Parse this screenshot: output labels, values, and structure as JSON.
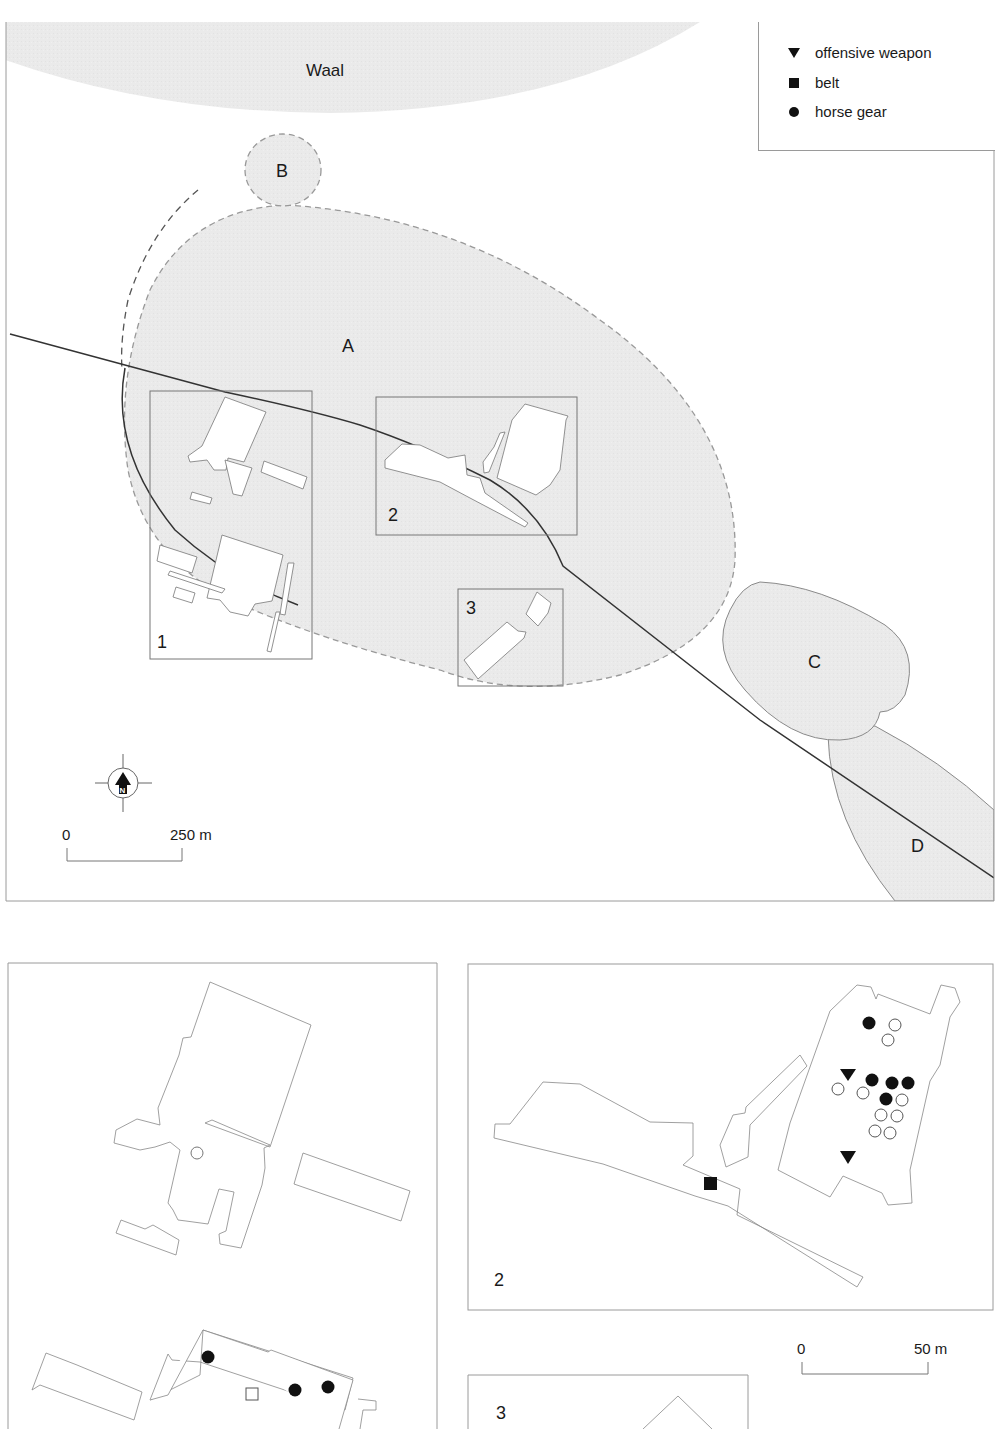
{
  "overview_map": {
    "river_label": "Waal",
    "zones": [
      {
        "id": "A",
        "label": "A"
      },
      {
        "id": "B",
        "label": "B"
      },
      {
        "id": "C",
        "label": "C"
      },
      {
        "id": "D",
        "label": "D"
      }
    ],
    "inset_boxes": [
      {
        "id": "1",
        "label": "1"
      },
      {
        "id": "2",
        "label": "2"
      },
      {
        "id": "3",
        "label": "3"
      }
    ],
    "north_arrow": {
      "label": "N"
    },
    "scale_bar": {
      "start": "0",
      "end": "250 m"
    }
  },
  "legend": {
    "items": [
      {
        "symbol": "triangle-down-filled",
        "label": "offensive weapon"
      },
      {
        "symbol": "square-filled",
        "label": "belt"
      },
      {
        "symbol": "circle-filled",
        "label": "horse gear"
      }
    ]
  },
  "detail_panels": {
    "panel_1": {
      "label": "1"
    },
    "panel_2": {
      "label": "2"
    },
    "panel_3": {
      "label": "3"
    },
    "scale_bar": {
      "start": "0",
      "end": "50 m"
    }
  },
  "colors": {
    "zone_fill": "#e9e9e9",
    "outline": "#8a8a8a",
    "road": "#333333",
    "marker": "#111111"
  }
}
